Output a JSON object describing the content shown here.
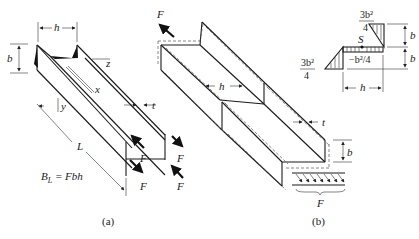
{
  "figure": {
    "panel_a": {
      "caption": "(a)",
      "labels": {
        "h": "h",
        "b": "b",
        "z": "z",
        "x": "x",
        "y": "y",
        "t": "t",
        "L": "L",
        "F1": "F",
        "F2": "F",
        "F3": "F",
        "F4": "F"
      },
      "equation": "B_L = Fbh",
      "equation_main": "B",
      "equation_sub": "L",
      "equation_rest": " = Fbh"
    },
    "panel_b": {
      "caption": "(b)",
      "labels": {
        "F_top": "F",
        "h": "h",
        "t": "t",
        "b": "b",
        "F_bottom": "F"
      }
    },
    "inset": {
      "labels": {
        "top_frac_num": "3b²",
        "top_frac_den": "4",
        "left_frac_num": "3b²",
        "left_frac_den": "4",
        "S": "S",
        "mid": "−b²/4",
        "b_upper": "b",
        "b_lower": "b",
        "h": "h"
      }
    }
  }
}
